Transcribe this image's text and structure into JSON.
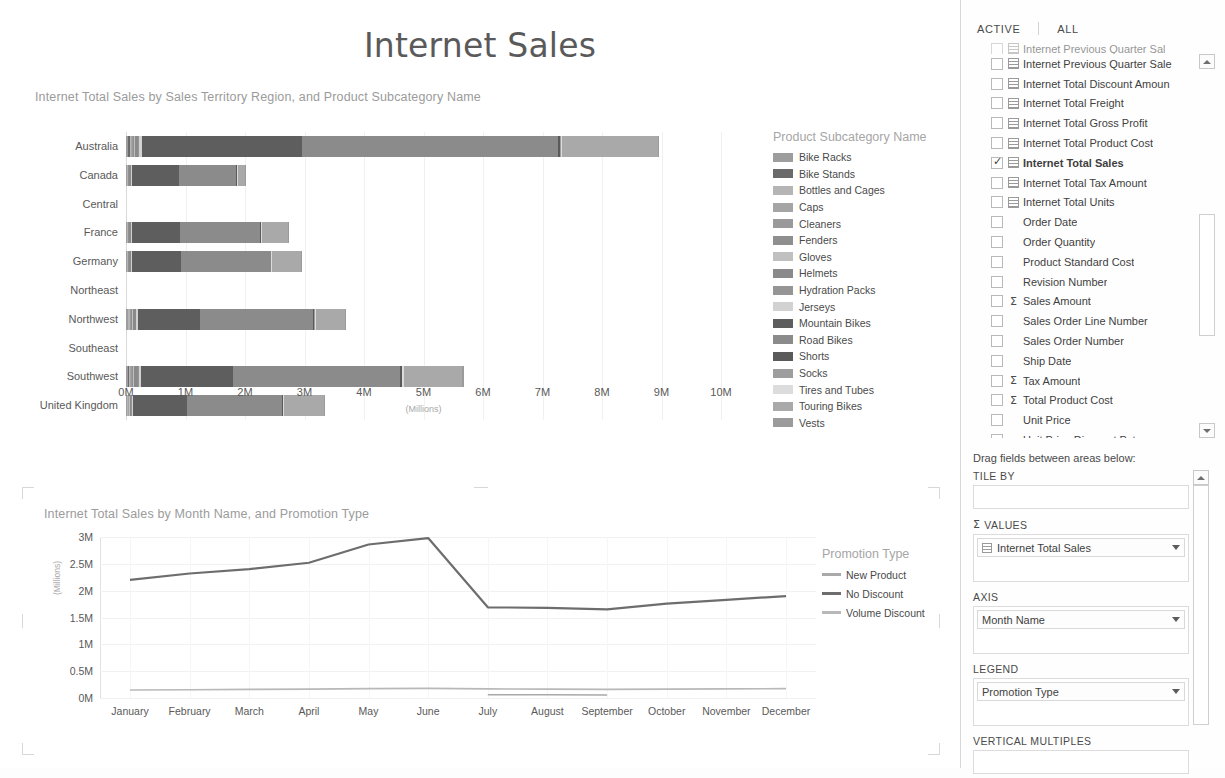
{
  "report": {
    "title": "Internet Sales"
  },
  "bar_visual": {
    "title": "Internet Total Sales by Sales Territory Region, and Product Subcategory Name",
    "axis_unit": "(Millions)",
    "legend_title": "Product Subcategory Name",
    "x_ticks": [
      "0M",
      "1M",
      "2M",
      "3M",
      "4M",
      "5M",
      "6M",
      "7M",
      "8M",
      "9M",
      "10M"
    ]
  },
  "line_visual": {
    "title": "Internet Total Sales by Month Name, and Promotion Type",
    "axis_unit": "(Millions)",
    "legend_title": "Promotion Type",
    "y_ticks": [
      "3M",
      "2.5M",
      "2M",
      "1.5M",
      "1M",
      "0.5M",
      "0M"
    ]
  },
  "chart_data": [
    {
      "type": "bar",
      "subtype": "stacked-horizontal",
      "title": "Internet Total Sales by Sales Territory Region, and Product Subcategory Name",
      "xlabel": "(Millions)",
      "ylabel": "Sales Territory Region",
      "xlim": [
        0,
        10000000
      ],
      "grid": true,
      "legend_position": "right",
      "legend_title": "Product Subcategory Name",
      "categories": [
        "Australia",
        "Canada",
        "Central",
        "France",
        "Germany",
        "Northeast",
        "Northwest",
        "Southeast",
        "Southwest",
        "United Kingdom"
      ],
      "series": [
        {
          "name": "Bike Racks",
          "color": "#9d9d9d",
          "values": [
            40000,
            12000,
            0,
            14000,
            13000,
            0,
            26000,
            0,
            30000,
            15000
          ]
        },
        {
          "name": "Bike Stands",
          "color": "#6a6a6a",
          "values": [
            25000,
            8000,
            0,
            9000,
            8000,
            0,
            16000,
            0,
            20000,
            10000
          ]
        },
        {
          "name": "Bottles and Cages",
          "color": "#b5b5b5",
          "values": [
            22000,
            9000,
            0,
            9000,
            9000,
            0,
            19000,
            0,
            24000,
            11000
          ]
        },
        {
          "name": "Caps",
          "color": "#a5a5a5",
          "values": [
            14000,
            6000,
            0,
            6000,
            6000,
            0,
            12000,
            0,
            15000,
            7000
          ]
        },
        {
          "name": "Cleaners",
          "color": "#9a9a9a",
          "values": [
            9000,
            4000,
            0,
            4000,
            4000,
            0,
            8000,
            0,
            10000,
            4500
          ]
        },
        {
          "name": "Fenders",
          "color": "#8f8f8f",
          "values": [
            23000,
            9000,
            0,
            9000,
            9000,
            0,
            19000,
            0,
            23000,
            11000
          ]
        },
        {
          "name": "Gloves",
          "color": "#c0c0c0",
          "values": [
            18000,
            7000,
            0,
            7000,
            7000,
            0,
            15000,
            0,
            18000,
            8000
          ]
        },
        {
          "name": "Helmets",
          "color": "#8a8a8a",
          "values": [
            57000,
            22000,
            0,
            23000,
            22000,
            0,
            46000,
            0,
            57000,
            25000
          ]
        },
        {
          "name": "Hydration Packs",
          "color": "#959595",
          "values": [
            16000,
            6000,
            0,
            6000,
            6000,
            0,
            13000,
            0,
            16000,
            7000
          ]
        },
        {
          "name": "Jerseys",
          "color": "#d2d2d2",
          "values": [
            42000,
            16000,
            0,
            17000,
            16000,
            0,
            34000,
            0,
            42000,
            19000
          ]
        },
        {
          "name": "Mountain Bikes",
          "color": "#5e5e5e",
          "values": [
            2700000,
            800000,
            0,
            800000,
            830000,
            0,
            1030000,
            0,
            1550000,
            900000
          ]
        },
        {
          "name": "Road Bikes",
          "color": "#8b8b8b",
          "values": [
            4300000,
            950000,
            0,
            1350000,
            1500000,
            0,
            1900000,
            0,
            2800000,
            1600000
          ]
        },
        {
          "name": "Shorts",
          "color": "#5a5a5a",
          "values": [
            32000,
            12000,
            0,
            13000,
            12000,
            0,
            26000,
            0,
            32000,
            14000
          ]
        },
        {
          "name": "Socks",
          "color": "#9e9e9e",
          "values": [
            7000,
            3000,
            0,
            3000,
            3000,
            0,
            6000,
            0,
            7000,
            3200
          ]
        },
        {
          "name": "Tires and Tubes",
          "color": "#dcdcdc",
          "values": [
            30000,
            12000,
            0,
            12000,
            12000,
            0,
            25000,
            0,
            31000,
            14000
          ]
        },
        {
          "name": "Touring Bikes",
          "color": "#a9a9a9",
          "values": [
            1600000,
            130000,
            0,
            440000,
            490000,
            0,
            480000,
            0,
            980000,
            680000
          ]
        },
        {
          "name": "Vests",
          "color": "#9b9b9b",
          "values": [
            24000,
            9000,
            0,
            10000,
            9000,
            0,
            19000,
            0,
            24000,
            11000
          ]
        }
      ],
      "category_totals": [
        9050000,
        2030000,
        0,
        2740000,
        2960000,
        0,
        3700000,
        0,
        5680000,
        3350000
      ]
    },
    {
      "type": "line",
      "title": "Internet Total Sales by Month Name, and Promotion Type",
      "xlabel": "Month Name",
      "ylabel": "(Millions)",
      "ylim": [
        0,
        3000000
      ],
      "yticks": [
        0,
        500000,
        1000000,
        1500000,
        2000000,
        2500000,
        3000000
      ],
      "grid": true,
      "legend_position": "right",
      "legend_title": "Promotion Type",
      "x": [
        "January",
        "February",
        "March",
        "April",
        "May",
        "June",
        "July",
        "August",
        "September",
        "October",
        "November",
        "December"
      ],
      "series": [
        {
          "name": "New Product",
          "color": "#a9a9a9",
          "values": [
            0,
            0,
            0,
            0,
            0,
            0,
            60000,
            60000,
            55000,
            0,
            0,
            0
          ]
        },
        {
          "name": "No Discount",
          "color": "#6d6d6d",
          "values": [
            2200000,
            2320000,
            2400000,
            2520000,
            2860000,
            2980000,
            1690000,
            1680000,
            1650000,
            1760000,
            1830000,
            1900000
          ]
        },
        {
          "name": "Volume Discount",
          "color": "#b8b8b8",
          "values": [
            150000,
            155000,
            160000,
            165000,
            175000,
            180000,
            170000,
            165000,
            160000,
            165000,
            170000,
            175000
          ]
        }
      ],
      "note_second_series_peak": "No Discount rises to 3M at June then drops to ~1.7M and rises to ~2.8M in December"
    }
  ],
  "field_panel": {
    "tabs": [
      {
        "label": "ACTIVE"
      },
      {
        "label": "ALL"
      }
    ],
    "fields": [
      {
        "label": "Internet Previous Quarter Sal",
        "type": "measure",
        "checked": false,
        "clipped": true
      },
      {
        "label": "Internet Previous Quarter Sale",
        "type": "measure",
        "checked": false
      },
      {
        "label": "Internet Total Discount Amoun",
        "type": "measure",
        "checked": false
      },
      {
        "label": "Internet Total Freight",
        "type": "measure",
        "checked": false
      },
      {
        "label": "Internet Total Gross Profit",
        "type": "measure",
        "checked": false
      },
      {
        "label": "Internet Total Product Cost",
        "type": "measure",
        "checked": false
      },
      {
        "label": "Internet Total Sales",
        "type": "measure",
        "checked": true
      },
      {
        "label": "Internet Total Tax Amount",
        "type": "measure",
        "checked": false
      },
      {
        "label": "Internet Total Units",
        "type": "measure",
        "checked": false
      },
      {
        "label": "Order Date",
        "type": "column",
        "checked": false
      },
      {
        "label": "Order Quantity",
        "type": "column",
        "checked": false
      },
      {
        "label": "Product Standard Cost",
        "type": "column",
        "checked": false
      },
      {
        "label": "Revision Number",
        "type": "column",
        "checked": false
      },
      {
        "label": "Sales Amount",
        "type": "sigma",
        "checked": false
      },
      {
        "label": "Sales Order Line Number",
        "type": "column",
        "checked": false
      },
      {
        "label": "Sales Order Number",
        "type": "column",
        "checked": false
      },
      {
        "label": "Ship Date",
        "type": "column",
        "checked": false
      },
      {
        "label": "Tax Amount",
        "type": "sigma",
        "checked": false
      },
      {
        "label": "Total Product Cost",
        "type": "sigma",
        "checked": false
      },
      {
        "label": "Unit Price",
        "type": "column",
        "checked": false
      },
      {
        "label": "Unit Price Discount Pct",
        "type": "column",
        "checked": false
      }
    ],
    "drag_hint": "Drag fields between areas below:",
    "areas": [
      {
        "label": "TILE BY",
        "sigma": false,
        "items": []
      },
      {
        "label": "VALUES",
        "sigma": true,
        "items": [
          {
            "label": "Internet Total Sales",
            "icon": "measure"
          }
        ]
      },
      {
        "label": "AXIS",
        "sigma": false,
        "items": [
          {
            "label": "Month Name",
            "icon": "none"
          }
        ]
      },
      {
        "label": "LEGEND",
        "sigma": false,
        "items": [
          {
            "label": "Promotion Type",
            "icon": "none"
          }
        ]
      },
      {
        "label": "VERTICAL MULTIPLES",
        "sigma": false,
        "items": []
      }
    ]
  }
}
